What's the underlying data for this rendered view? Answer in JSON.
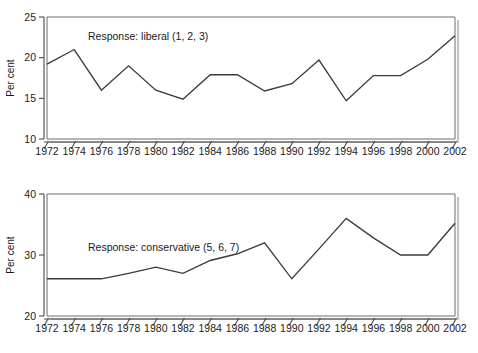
{
  "figure": {
    "background": "#ffffff",
    "line_color": "#3b3b3b",
    "axis_color": "#4a4a4a",
    "text_color": "#1a1a1a"
  },
  "panels": [
    {
      "id": "top",
      "annotation": "Response: liberal (1, 2, 3)",
      "ylabel": "Per cent",
      "yticks": [
        "10",
        "15",
        "20",
        "25"
      ],
      "xticks": [
        "1972",
        "1974",
        "1976",
        "1978",
        "1980",
        "1982",
        "1984",
        "1986",
        "1988",
        "1990",
        "1992",
        "1994",
        "1996",
        "1998",
        "2000",
        "2002"
      ]
    },
    {
      "id": "bottom",
      "annotation": "Response: conservative (5, 6, 7)",
      "ylabel": "Per cent",
      "yticks": [
        "20",
        "30",
        "40"
      ],
      "xticks": [
        "1972",
        "1974",
        "1976",
        "1978",
        "1980",
        "1982",
        "1984",
        "1986",
        "1988",
        "1990",
        "1992",
        "1994",
        "1996",
        "1998",
        "2000",
        "2002"
      ]
    }
  ],
  "chart_data": [
    {
      "type": "line",
      "title": "",
      "annotation": "Response: liberal (1, 2, 3)",
      "xlabel": "",
      "ylabel": "Per cent",
      "xlim": [
        1972,
        2002
      ],
      "ylim": [
        10,
        25
      ],
      "yticks": [
        10,
        15,
        20,
        25
      ],
      "grid": false,
      "legend": "none",
      "x": [
        1972,
        1974,
        1976,
        1978,
        1980,
        1982,
        1984,
        1986,
        1988,
        1990,
        1992,
        1994,
        1996,
        1998,
        2000,
        2002
      ],
      "categories": [
        "1972",
        "1974",
        "1976",
        "1978",
        "1980",
        "1982",
        "1984",
        "1986",
        "1988",
        "1990",
        "1992",
        "1994",
        "1996",
        "1998",
        "2000",
        "2002"
      ],
      "values": [
        19.2,
        21.0,
        16.0,
        19.0,
        16.0,
        14.9,
        17.9,
        17.9,
        15.9,
        16.8,
        19.7,
        14.7,
        17.8,
        17.8,
        19.8,
        22.7
      ]
    },
    {
      "type": "line",
      "title": "",
      "annotation": "Response: conservative (5, 6, 7)",
      "xlabel": "",
      "ylabel": "Per cent",
      "xlim": [
        1972,
        2002
      ],
      "ylim": [
        20,
        40
      ],
      "yticks": [
        20,
        30,
        40
      ],
      "grid": false,
      "legend": "none",
      "x": [
        1972,
        1974,
        1976,
        1978,
        1980,
        1982,
        1984,
        1986,
        1988,
        1990,
        1992,
        1994,
        1996,
        1998,
        2000,
        2002
      ],
      "categories": [
        "1972",
        "1974",
        "1976",
        "1978",
        "1980",
        "1982",
        "1984",
        "1986",
        "1988",
        "1990",
        "1992",
        "1994",
        "1996",
        "1998",
        "2000",
        "2002"
      ],
      "values": [
        26.1,
        26.1,
        26.1,
        27.0,
        28.0,
        27.0,
        29.1,
        30.2,
        32.0,
        26.1,
        31.0,
        36.0,
        32.8,
        30.0,
        30.0,
        35.2
      ]
    }
  ]
}
